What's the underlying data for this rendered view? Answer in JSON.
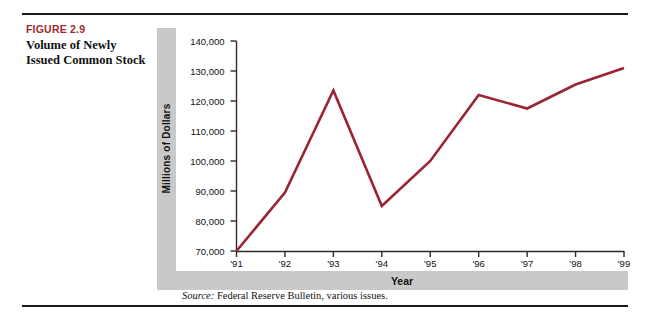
{
  "figure": {
    "number": "FIGURE 2.9",
    "title": "Volume of Newly\nIssued Common Stock",
    "title_line1": "Volume of Newly",
    "title_line2": "Issued Common Stock",
    "source_label": "Source:",
    "source_text": " Federal Reserve Bulletin, various issues."
  },
  "colors": {
    "accent": "#9e2a2f",
    "line": "#9b2433",
    "band": "#c9c9c9",
    "axis": "#2b2b2b",
    "rule": "#1a1a1a"
  },
  "chart_data": {
    "type": "line",
    "title": "Volume of Newly Issued Common Stock",
    "xlabel": "Year",
    "ylabel": "Millions of Dollars",
    "categories": [
      "'91",
      "'92",
      "'93",
      "'94",
      "'95",
      "'96",
      "'97",
      "'98",
      "'99"
    ],
    "values": [
      70000,
      89500,
      123500,
      85000,
      100000,
      122000,
      117500,
      125500,
      131000
    ],
    "ylim": [
      70000,
      140000
    ],
    "yticks": [
      70000,
      80000,
      90000,
      100000,
      110000,
      120000,
      130000,
      140000
    ],
    "ytick_labels": [
      "70,000",
      "80,000",
      "90,000",
      "100,000",
      "110,000",
      "120,000",
      "130,000",
      "140,000"
    ],
    "grid": false,
    "legend": null,
    "series": [
      {
        "name": "Volume of Newly Issued Common Stock",
        "values": [
          70000,
          89500,
          123500,
          85000,
          100000,
          122000,
          117500,
          125500,
          131000
        ]
      }
    ]
  }
}
